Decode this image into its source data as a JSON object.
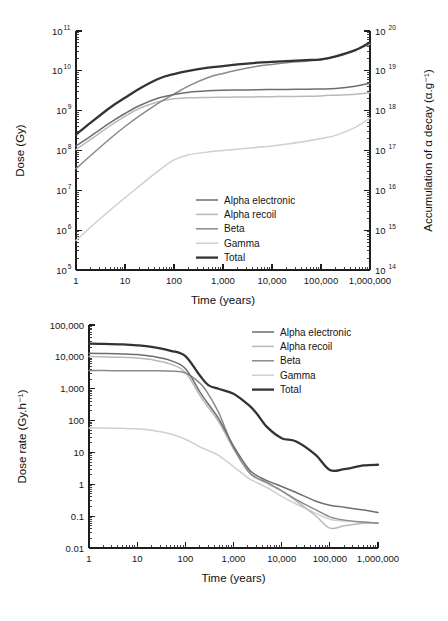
{
  "figure": {
    "panels": [
      "dose-accumulation",
      "dose-rate"
    ]
  },
  "series_style": {
    "alpha_electronic": {
      "color": "#6e6e6e",
      "width": 1.5
    },
    "alpha_recoil": {
      "color": "#b9b9b9",
      "width": 1.5
    },
    "beta": {
      "color": "#8a8a8a",
      "width": 1.5
    },
    "gamma": {
      "color": "#cfcfcf",
      "width": 1.5
    },
    "total": {
      "color": "#333333",
      "width": 2.3
    }
  },
  "chart_data": [
    {
      "id": "dose-accumulation",
      "type": "line",
      "title": "",
      "xlabel": "Time (years)",
      "ylabel": "Dose (Gy)",
      "y2label": "Accumulation of α decay (α.g⁻¹)",
      "xscale": "log",
      "yscale": "log",
      "xlim": [
        1,
        1000000
      ],
      "ylim": [
        100000,
        100000000000
      ],
      "y2lim": [
        100000000000000.0,
        1e+20
      ],
      "grid": false,
      "legend_position": "lower-right",
      "xticklabels": [
        "1",
        "10",
        "100",
        "1,000",
        "10,000",
        "100,000",
        "1,000,000"
      ],
      "xtickvalues": [
        1,
        10,
        100,
        1000,
        10000,
        100000,
        1000000
      ],
      "yticklabels": [
        "10^5",
        "10^6",
        "10^7",
        "10^8",
        "10^9",
        "10^10",
        "10^11"
      ],
      "ytickvalues": [
        100000,
        1000000,
        10000000,
        100000000,
        1000000000,
        10000000000,
        100000000000
      ],
      "y2ticklabels": [
        "10^14",
        "10^15",
        "10^16",
        "10^17",
        "10^18",
        "10^19",
        "10^20"
      ],
      "y2tickvalues": [
        100000000000000.0,
        1000000000000000.0,
        1e+16,
        1e+17,
        1e+18,
        1e+19,
        1e+20
      ],
      "x": [
        1,
        2,
        5,
        10,
        20,
        50,
        100,
        200,
        500,
        1000,
        2000,
        5000,
        10000,
        20000,
        50000,
        100000,
        200000,
        500000,
        1000000
      ],
      "series": [
        {
          "name": "Alpha electronic",
          "key": "alpha_electronic",
          "values": [
            130000000.0,
            230000000.0,
            500000000.0,
            850000000.0,
            1350000000.0,
            2100000000.0,
            2550000000.0,
            2900000000.0,
            3150000000.0,
            3250000000.0,
            3300000000.0,
            3350000000.0,
            3400000000.0,
            3420000000.0,
            3450000000.0,
            3500000000.0,
            3600000000.0,
            4100000000.0,
            4900000000.0
          ]
        },
        {
          "name": "Alpha recoil",
          "key": "alpha_recoil",
          "values": [
            105000000.0,
            190000000.0,
            420000000.0,
            720000000.0,
            1150000000.0,
            1700000000.0,
            2000000000.0,
            2100000000.0,
            2150000000.0,
            2180000000.0,
            2200000000.0,
            2220000000.0,
            2250000000.0,
            2270000000.0,
            2300000000.0,
            2350000000.0,
            2450000000.0,
            2600000000.0,
            2850000000.0
          ]
        },
        {
          "name": "Beta",
          "key": "beta",
          "values": [
            35000000.0,
            75000000.0,
            200000000.0,
            400000000.0,
            750000000.0,
            1600000000.0,
            2600000000.0,
            4200000000.0,
            6800000000.0,
            8600000000.0,
            10500000000.0,
            13000000000.0,
            14500000000.0,
            16000000000.0,
            17500000000.0,
            19000000000.0,
            23000000000.0,
            33000000000.0,
            47000000000.0
          ]
        },
        {
          "name": "Gamma",
          "key": "gamma",
          "values": [
            550000.0,
            1200000.0,
            3200000.0,
            6500000.0,
            13000000.0,
            32000000.0,
            58000000.0,
            78000000.0,
            92000000.0,
            100000000.0,
            108000000.0,
            120000000.0,
            130000000.0,
            145000000.0,
            170000000.0,
            200000000.0,
            240000000.0,
            380000000.0,
            650000000.0
          ]
        },
        {
          "name": "Total",
          "key": "total",
          "values": [
            250000000.0,
            500000000.0,
            1200000000.0,
            2100000000.0,
            3600000000.0,
            6400000000.0,
            8300000000.0,
            10000000000.0,
            12000000000.0,
            13200000000.0,
            14500000000.0,
            16000000000.0,
            16800000000.0,
            17500000000.0,
            18500000000.0,
            19500000000.0,
            23000000000.0,
            33000000000.0,
            52000000000.0
          ]
        }
      ]
    },
    {
      "id": "dose-rate",
      "type": "line",
      "title": "",
      "xlabel": "Time (years)",
      "ylabel": "Dose rate (Gy.h⁻¹)",
      "xscale": "log",
      "yscale": "log",
      "xlim": [
        1,
        1000000
      ],
      "ylim": [
        0.01,
        100000
      ],
      "grid": false,
      "legend_position": "upper-right",
      "xticklabels": [
        "1",
        "10",
        "100",
        "1,000",
        "10,000",
        "100,000",
        "1,000,000"
      ],
      "xtickvalues": [
        1,
        10,
        100,
        1000,
        10000,
        100000,
        1000000
      ],
      "yticklabels": [
        "100,000",
        "10,000",
        "1,000",
        "100",
        "10",
        "1",
        "0.1",
        "0.01"
      ],
      "ytickvalues": [
        100000,
        10000,
        1000,
        100,
        10,
        1,
        0.1,
        0.01
      ],
      "x": [
        1,
        2,
        5,
        10,
        20,
        50,
        100,
        200,
        300,
        500,
        1000,
        2000,
        3000,
        5000,
        10000,
        20000,
        50000,
        100000,
        200000,
        500000,
        1000000
      ],
      "series": [
        {
          "name": "Alpha electronic",
          "key": "alpha_electronic",
          "values": [
            13000,
            12800,
            12400,
            11800,
            10500,
            7600,
            4300,
            800,
            330,
            110,
            16,
            3.2,
            1.9,
            1.3,
            0.85,
            0.55,
            0.3,
            0.22,
            0.19,
            0.155,
            0.13
          ]
        },
        {
          "name": "Alpha recoil",
          "key": "alpha_recoil",
          "values": [
            10200,
            10000,
            9700,
            9200,
            8200,
            5900,
            3300,
            620,
            260,
            88,
            13,
            2.6,
            1.55,
            1.05,
            0.62,
            0.3,
            0.105,
            0.042,
            0.05,
            0.06,
            0.062
          ]
        },
        {
          "name": "Beta",
          "key": "beta",
          "values": [
            3700,
            3700,
            3690,
            3680,
            3650,
            3550,
            3100,
            1500,
            680,
            170,
            14,
            2.6,
            1.6,
            1.15,
            0.62,
            0.33,
            0.16,
            0.095,
            0.075,
            0.065,
            0.06
          ]
        },
        {
          "name": "Gamma",
          "key": "gamma",
          "values": [
            58,
            58,
            57,
            55,
            50,
            38,
            26,
            15,
            11.5,
            8.0,
            3.6,
            1.6,
            1.15,
            0.78,
            0.42,
            0.24,
            0.125,
            0.08,
            0.07,
            0.065,
            0.06
          ]
        },
        {
          "name": "Total",
          "key": "total",
          "values": [
            26000,
            25500,
            24500,
            23000,
            20500,
            15500,
            10500,
            2600,
            1300,
            980,
            700,
            320,
            170,
            62,
            28,
            22,
            8.5,
            2.8,
            3.0,
            3.9,
            4.1
          ]
        }
      ]
    }
  ],
  "legend": {
    "top": {
      "entries": [
        "Alpha electronic",
        "Alpha recoil",
        "Beta",
        "Gamma",
        "Total"
      ],
      "keys": [
        "alpha_electronic",
        "alpha_recoil",
        "beta",
        "gamma",
        "total"
      ]
    },
    "bottom": {
      "entries": [
        "Alpha electronic",
        "Alpha recoil",
        "Beta",
        "Gamma",
        "Total"
      ],
      "keys": [
        "alpha_electronic",
        "alpha_recoil",
        "beta",
        "gamma",
        "total"
      ]
    }
  }
}
